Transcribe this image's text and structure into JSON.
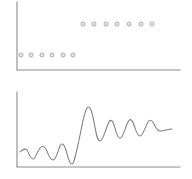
{
  "figure": {
    "title": "",
    "background_color": "#ffffff",
    "panel_count": 2
  },
  "panels": {
    "top": {
      "name": "scatter-panel",
      "axis_color": "#8c8c8c",
      "marker_color": "#9a9a9a",
      "axes": {
        "y_axis_x": 17,
        "y_axis_top": 2,
        "y_axis_bottom": 70,
        "x_axis_y": 70,
        "x_axis_left": 17,
        "x_axis_right": 180
      }
    },
    "bottom": {
      "name": "waveform-panel",
      "axis_color": "#8c8c8c",
      "line_color": "#7e7e7e",
      "axes": {
        "y_axis_x": 17,
        "y_axis_top": 4,
        "y_axis_bottom": 79,
        "x_axis_y": 79,
        "x_axis_left": 17,
        "x_axis_right": 180
      }
    }
  },
  "chart_data": [
    {
      "type": "scatter",
      "title": "",
      "xlabel": "",
      "ylabel": "",
      "xlim": [
        0,
        192
      ],
      "ylim": [
        0,
        88
      ],
      "grid": false,
      "legend": null,
      "marker_style": "open-circle",
      "marker_radius": 2.0,
      "series": [
        {
          "name": "low-level-group",
          "points": [
            {
              "x": 21,
              "y": 55
            },
            {
              "x": 31,
              "y": 55
            },
            {
              "x": 42,
              "y": 55
            },
            {
              "x": 52,
              "y": 55
            },
            {
              "x": 63,
              "y": 55
            },
            {
              "x": 73,
              "y": 55
            }
          ]
        },
        {
          "name": "high-level-group",
          "points": [
            {
              "x": 83,
              "y": 24
            },
            {
              "x": 94,
              "y": 24
            },
            {
              "x": 106,
              "y": 24
            },
            {
              "x": 117,
              "y": 24
            },
            {
              "x": 129,
              "y": 24
            },
            {
              "x": 141,
              "y": 24
            },
            {
              "x": 152,
              "y": 24
            }
          ]
        }
      ]
    },
    {
      "type": "line",
      "title": "",
      "xlabel": "",
      "ylabel": "",
      "xlim": [
        0,
        192
      ],
      "ylim": [
        0,
        91
      ],
      "grid": false,
      "legend": null,
      "series": [
        {
          "name": "damped-step-response",
          "path": "M 20,64 C 23,61 25,60 27,62 C 29,65 30,71 33,71 C 36,71 37,63 40,60 C 43,57 45,59 47,63 C 49,68 50,72 53,72 C 56,72 58,63 60,58 C 62,54 64,56 66,62 C 68,69 69,76 72,76 C 74,76 76,66 79,52 C 82,38 84,24 87,20 C 90,16 92,24 94,34 C 96,44 97,53 100,53 C 103,53 105,43 108,36 C 110,31 112,31 114,37 C 116,43 117,50 120,50 C 123,50 125,40 128,34 C 130,30 132,31 134,37 C 136,42 137,48 140,48 C 143,48 145,39 148,34 C 150,31 152,32 154,36 C 156,40 157,43 160,43 C 164,43 168,41 172,41"
        }
      ]
    }
  ]
}
